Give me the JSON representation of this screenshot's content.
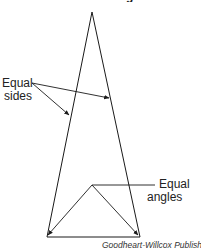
{
  "figure": {
    "title_fragment": "g",
    "labels": {
      "equal_sides_line1": "Equal",
      "equal_sides_line2": "sides",
      "equal_angles_line1": "Equal",
      "equal_angles_line2": "angles"
    },
    "credit": "Goodheart-Willcox Publisher",
    "shape": "isosceles-triangle",
    "line_color": "#1a1a1a"
  }
}
